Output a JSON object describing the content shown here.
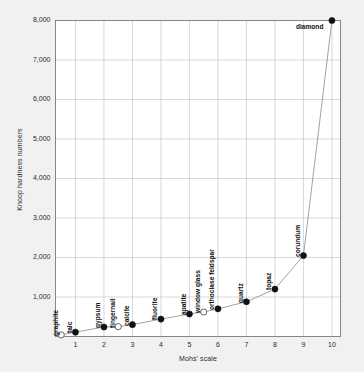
{
  "chart_data": {
    "type": "scatter",
    "title": "",
    "xlabel": "Mohs' scale",
    "ylabel": "Knoop hardness numbers",
    "xlim": [
      0.3,
      10.3
    ],
    "ylim": [
      0,
      8000
    ],
    "grid": true,
    "legend": null,
    "xticks": [
      "1",
      "2",
      "3",
      "4",
      "5",
      "6",
      "7",
      "8",
      "9",
      "10"
    ],
    "xtick_values": [
      1,
      2,
      3,
      4,
      5,
      6,
      7,
      8,
      9,
      10
    ],
    "yticks": [
      "1,000",
      "2,000",
      "3,000",
      "4,000",
      "5,000",
      "6,000",
      "7,000",
      "8,000"
    ],
    "ytick_values": [
      1000,
      2000,
      3000,
      4000,
      5000,
      6000,
      7000,
      8000
    ],
    "series": [
      {
        "name": "Mohs minerals and references",
        "marker_filled_color": "#111111",
        "marker_open_color": "#ffffff",
        "line_color": "#8a8a8a",
        "points": [
          {
            "label": "graphite",
            "x": 0.5,
            "y": 40,
            "filled": false,
            "label_rotated": true
          },
          {
            "label": "talc",
            "x": 1.0,
            "y": 110,
            "filled": true,
            "label_rotated": true
          },
          {
            "label": "gypsum",
            "x": 2.0,
            "y": 240,
            "filled": true,
            "label_rotated": true
          },
          {
            "label": "fingernail",
            "x": 2.5,
            "y": 250,
            "filled": false,
            "label_rotated": true
          },
          {
            "label": "calcite",
            "x": 3.0,
            "y": 300,
            "filled": true,
            "label_rotated": true
          },
          {
            "label": "fluorite",
            "x": 4.0,
            "y": 440,
            "filled": true,
            "label_rotated": true
          },
          {
            "label": "apatite",
            "x": 5.0,
            "y": 570,
            "filled": true,
            "label_rotated": true
          },
          {
            "label": "window glass",
            "x": 5.5,
            "y": 620,
            "filled": false,
            "label_rotated": true
          },
          {
            "label": "orthoclase feldspar",
            "x": 6.0,
            "y": 700,
            "filled": true,
            "label_rotated": true
          },
          {
            "label": "quartz",
            "x": 7.0,
            "y": 880,
            "filled": true,
            "label_rotated": true
          },
          {
            "label": "topaz",
            "x": 8.0,
            "y": 1200,
            "filled": true,
            "label_rotated": true
          },
          {
            "label": "corundum",
            "x": 9.0,
            "y": 2050,
            "filled": true,
            "label_rotated": true
          },
          {
            "label": "diamond",
            "x": 10.0,
            "y": 8000,
            "filled": true,
            "label_rotated": false
          }
        ]
      }
    ]
  },
  "colors": {
    "page_background": "#f1f1f1",
    "plot_background": "#ffffff",
    "grid": "#bdbdbd",
    "frame": "#7a7a7a",
    "text": "#2b2b2b",
    "marker": "#111111",
    "line": "#8a8a8a"
  }
}
